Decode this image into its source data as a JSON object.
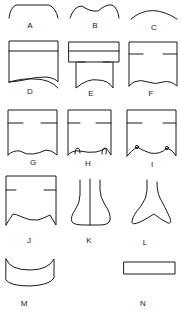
{
  "figure": {
    "panels": [
      {
        "id": "A",
        "label": "A"
      },
      {
        "id": "B",
        "label": "B"
      },
      {
        "id": "C",
        "label": "C"
      },
      {
        "id": "D",
        "label": "D"
      },
      {
        "id": "E",
        "label": "E"
      },
      {
        "id": "F",
        "label": "F"
      },
      {
        "id": "G",
        "label": "G"
      },
      {
        "id": "H",
        "label": "H"
      },
      {
        "id": "I",
        "label": "I"
      },
      {
        "id": "J",
        "label": "J"
      },
      {
        "id": "K",
        "label": "K"
      },
      {
        "id": "L",
        "label": "L"
      },
      {
        "id": "M",
        "label": "M"
      },
      {
        "id": "N",
        "label": "N"
      }
    ],
    "stroke_color": "#1a1a1a",
    "background": "#ffffff"
  }
}
